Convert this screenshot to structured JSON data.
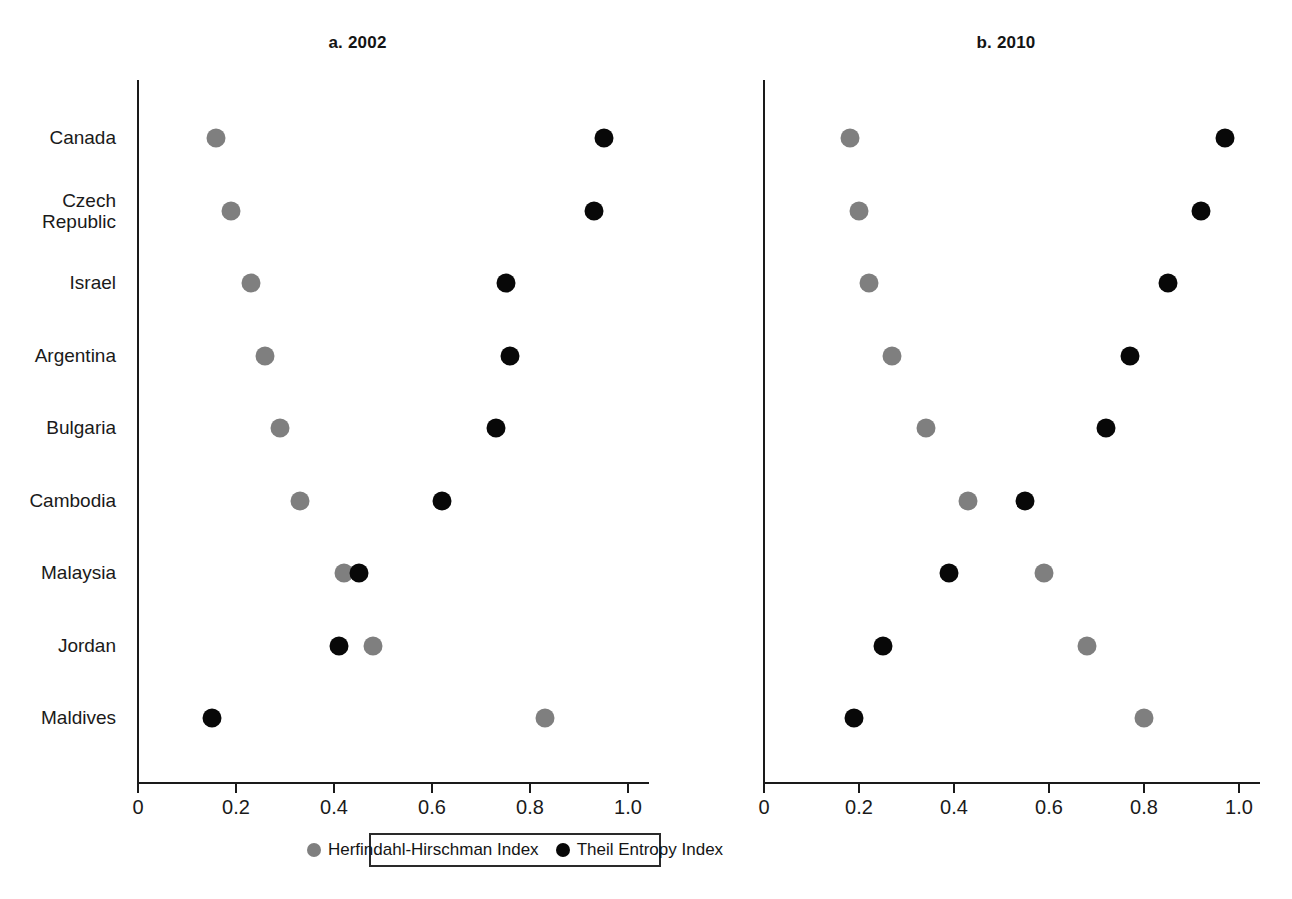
{
  "figure": {
    "legend": {
      "items": [
        {
          "label": "Herfindahl-Hirschman Index",
          "color": "#7f7f7f",
          "series": "hhi"
        },
        {
          "label": "Theil Entropy Index",
          "color": "#080808",
          "series": "theil"
        }
      ]
    }
  },
  "chart_data": [
    {
      "id": "panel-a",
      "type": "scatter",
      "title": "a. 2002",
      "xlabel": "",
      "ylabel": "",
      "xlim": [
        0,
        1.05
      ],
      "xticks": [
        0,
        0.2,
        0.4,
        0.6,
        0.8,
        1.0
      ],
      "xticklabels": [
        "0",
        "0.2",
        "0.4",
        "0.6",
        "0.8",
        "1.0"
      ],
      "grid": false,
      "legend_position": "bottom-center-shared",
      "categories": [
        "Czech\nRepublic",
        "Canada",
        "Israel",
        "Argentina",
        "Malaysia",
        "Bulgaria",
        "Jordan",
        "Cambodia",
        "Maldives"
      ],
      "series": [
        {
          "name": "Herfindahl-Hirschman Index",
          "color": "#7f7f7f",
          "values": [
            0.16,
            0.19,
            0.23,
            0.26,
            0.29,
            0.33,
            0.42,
            0.48,
            0.83
          ]
        },
        {
          "name": "Theil Entropy Index",
          "color": "#080808",
          "values": [
            0.95,
            0.93,
            0.75,
            0.76,
            0.73,
            0.62,
            0.45,
            0.41,
            0.15
          ]
        }
      ]
    },
    {
      "id": "panel-b",
      "type": "scatter",
      "title": "b. 2010",
      "xlabel": "",
      "ylabel": "",
      "xlim": [
        0,
        1.05
      ],
      "xticks": [
        0,
        0.2,
        0.4,
        0.6,
        0.8,
        1.0
      ],
      "xticklabels": [
        "0",
        "0.2",
        "0.4",
        "0.6",
        "0.8",
        "1.0"
      ],
      "grid": false,
      "legend_position": "bottom-center-shared",
      "categories": [
        "Canada",
        "Czech\nRepublic",
        "Israel",
        "Argentina",
        "Bulgaria",
        "Cambodia",
        "Malaysia",
        "Jordan",
        "Maldives"
      ],
      "series": [
        {
          "name": "Herfindahl-Hirschman Index",
          "color": "#7f7f7f",
          "values": [
            0.18,
            0.2,
            0.22,
            0.27,
            0.34,
            0.43,
            0.59,
            0.68,
            0.8
          ]
        },
        {
          "name": "Theil Entropy Index",
          "color": "#080808",
          "values": [
            0.97,
            0.92,
            0.85,
            0.77,
            0.72,
            0.55,
            0.39,
            0.25,
            0.19
          ]
        }
      ]
    }
  ]
}
